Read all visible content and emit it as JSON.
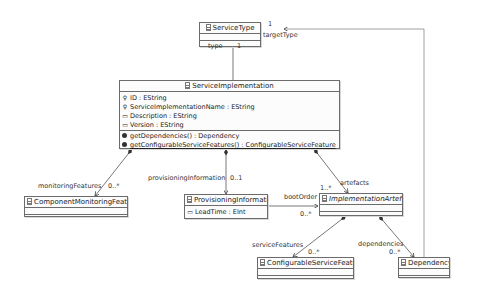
{
  "diagram": {
    "classes": {
      "service_type": {
        "name": "ServiceType",
        "attributes": [],
        "operations": []
      },
      "service_implementation": {
        "name": "ServiceImplementation",
        "attributes": [
          {
            "icon": "key-icon",
            "text": "ID : EString"
          },
          {
            "icon": "key-icon",
            "text": "ServiceImplementationName : EString"
          },
          {
            "icon": "attribute-icon",
            "text": "Description : EString"
          },
          {
            "icon": "attribute-icon",
            "text": "Version : EString"
          }
        ],
        "operations": [
          {
            "text": "getDependencies() : Dependency"
          },
          {
            "text": "getConfigurableServiceFeatures() : ConfigurableServiceFeature"
          }
        ]
      },
      "component_monitoring_features": {
        "name": "ComponentMonitoringFeatures"
      },
      "provisioning_information": {
        "name": "ProvisioningInformation",
        "attributes": [
          {
            "icon": "attribute-icon",
            "text": "LeadTime : EInt"
          }
        ]
      },
      "implementation_artefact": {
        "name": "ImplementationArtefact",
        "abstract": true
      },
      "configurable_service_feature": {
        "name": "ConfigurableServiceFeature"
      },
      "dependency": {
        "name": "Dependency"
      }
    },
    "edges": {
      "type": {
        "role": "type",
        "multiplicity": "1"
      },
      "target_type": {
        "role": "targetType",
        "multiplicity": "1"
      },
      "monitoring_features": {
        "role": "monitoringFeatures",
        "multiplicity": "0..*"
      },
      "provisioning_information": {
        "role": "provisioningInformation",
        "multiplicity": "0..1"
      },
      "artefacts": {
        "role": "artefacts",
        "multiplicity": "1..*"
      },
      "boot_order": {
        "role": "bootOrder",
        "multiplicity": "0..*"
      },
      "service_features": {
        "role": "serviceFeatures",
        "multiplicity": "0..*"
      },
      "dependencies": {
        "role": "dependencies",
        "multiplicity": "0..*"
      }
    }
  }
}
